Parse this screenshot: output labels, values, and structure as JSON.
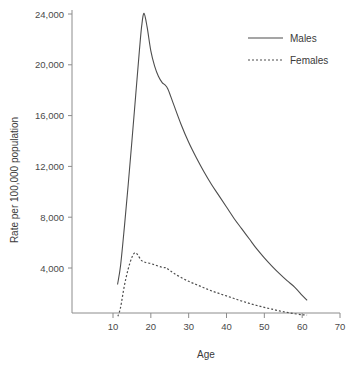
{
  "chart_data": {
    "type": "line",
    "title": "",
    "xlabel": "Age",
    "ylabel": "Rate per 100,000 population",
    "xlim": [
      0,
      70
    ],
    "ylim": [
      0,
      25400
    ],
    "grid": false,
    "legend_position": "top-right",
    "x_ticks": [
      10,
      20,
      30,
      40,
      50,
      60,
      70
    ],
    "x_tick_labels": [
      "10",
      "20",
      "30",
      "40",
      "50",
      "60",
      "70"
    ],
    "y_ticks": [
      4000,
      8000,
      12000,
      16000,
      20000,
      24000
    ],
    "y_tick_labels": [
      "4,000",
      "8,000",
      "12,000",
      "16,000",
      "20,000",
      "24,000"
    ],
    "series": [
      {
        "name": "Males",
        "style": "solid",
        "color": "#4d4d4d",
        "x": [
          11.2,
          12,
          13,
          14,
          15,
          16,
          17,
          17.6,
          18.2,
          19,
          20,
          21,
          22,
          23,
          23.6,
          24.5,
          26,
          28,
          30,
          32,
          34,
          36,
          38,
          40,
          42,
          44,
          46,
          48,
          50,
          52,
          54,
          56,
          58,
          60,
          61.3
        ],
        "y": [
          2700,
          4200,
          7200,
          10500,
          14000,
          17600,
          21200,
          23100,
          24050,
          23000,
          21100,
          19900,
          19100,
          18600,
          18450,
          18100,
          16900,
          15300,
          13900,
          12700,
          11600,
          10600,
          9700,
          8800,
          7900,
          7100,
          6300,
          5500,
          4800,
          4150,
          3550,
          3000,
          2500,
          1850,
          1450
        ]
      },
      {
        "name": "Females",
        "style": "dotted",
        "color": "#4d4d4d",
        "x": [
          11.3,
          12,
          13,
          14,
          15,
          15.8,
          16.5,
          17.5,
          18.5,
          20,
          21.5,
          23,
          24,
          24.6,
          26,
          28,
          30,
          32,
          34,
          36,
          38,
          40,
          42,
          44,
          46,
          48,
          50,
          52,
          54,
          56,
          58,
          60,
          61.3
        ],
        "y": [
          200,
          900,
          2600,
          3900,
          4850,
          5200,
          5050,
          4600,
          4450,
          4350,
          4200,
          4050,
          4020,
          3900,
          3600,
          3250,
          2950,
          2700,
          2450,
          2200,
          2000,
          1800,
          1600,
          1400,
          1220,
          1050,
          900,
          760,
          620,
          500,
          400,
          320,
          290
        ]
      }
    ],
    "annotations": {
      "males_peak": {
        "age": 18.2,
        "rate": 24050
      },
      "females_peak": {
        "age": 15.8,
        "rate": 5200
      }
    }
  },
  "legend": {
    "items": [
      {
        "label": "Males",
        "style": "solid"
      },
      {
        "label": "Females",
        "style": "dotted"
      }
    ]
  }
}
